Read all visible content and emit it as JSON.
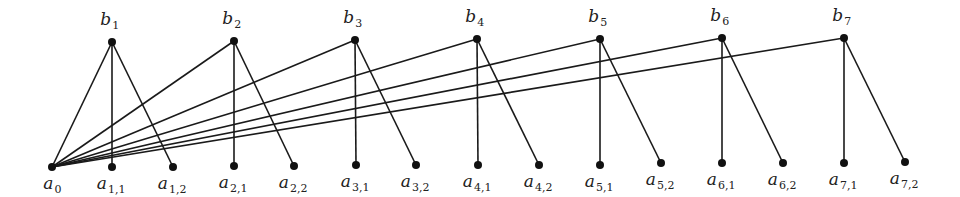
{
  "diagram": {
    "type": "graph",
    "colors": {
      "edge": "#1a1a1a",
      "node": "#111111",
      "label": "#222222",
      "background": "#ffffff"
    },
    "nodes": [
      {
        "id": "a0",
        "base": "a",
        "sub": "0",
        "x": 52,
        "y": 167,
        "label_pos": "below"
      },
      {
        "id": "b1",
        "base": "b",
        "sub": "1",
        "x": 112,
        "y": 42,
        "label_pos": "above"
      },
      {
        "id": "b2",
        "base": "b",
        "sub": "2",
        "x": 234,
        "y": 41,
        "label_pos": "above"
      },
      {
        "id": "b3",
        "base": "b",
        "sub": "3",
        "x": 355,
        "y": 40,
        "label_pos": "above"
      },
      {
        "id": "b4",
        "base": "b",
        "sub": "4",
        "x": 477,
        "y": 39,
        "label_pos": "above"
      },
      {
        "id": "b5",
        "base": "b",
        "sub": "5",
        "x": 600,
        "y": 39,
        "label_pos": "above"
      },
      {
        "id": "b6",
        "base": "b",
        "sub": "6",
        "x": 722,
        "y": 38,
        "label_pos": "above"
      },
      {
        "id": "b7",
        "base": "b",
        "sub": "7",
        "x": 844,
        "y": 38,
        "label_pos": "above"
      },
      {
        "id": "a11",
        "base": "a",
        "sub": "1,1",
        "x": 112,
        "y": 167,
        "label_pos": "below"
      },
      {
        "id": "a12",
        "base": "a",
        "sub": "1,2",
        "x": 173,
        "y": 167,
        "label_pos": "below"
      },
      {
        "id": "a21",
        "base": "a",
        "sub": "2,1",
        "x": 234,
        "y": 166,
        "label_pos": "below"
      },
      {
        "id": "a22",
        "base": "a",
        "sub": "2,2",
        "x": 294,
        "y": 166,
        "label_pos": "below"
      },
      {
        "id": "a31",
        "base": "a",
        "sub": "3,1",
        "x": 356,
        "y": 165,
        "label_pos": "below"
      },
      {
        "id": "a32",
        "base": "a",
        "sub": "3,2",
        "x": 416,
        "y": 165,
        "label_pos": "below"
      },
      {
        "id": "a41",
        "base": "a",
        "sub": "4,1",
        "x": 478,
        "y": 165,
        "label_pos": "below"
      },
      {
        "id": "a42",
        "base": "a",
        "sub": "4,2",
        "x": 539,
        "y": 165,
        "label_pos": "below"
      },
      {
        "id": "a51",
        "base": "a",
        "sub": "5,1",
        "x": 600,
        "y": 165,
        "label_pos": "below"
      },
      {
        "id": "a52",
        "base": "a",
        "sub": "5,2",
        "x": 661,
        "y": 163,
        "label_pos": "below"
      },
      {
        "id": "a61",
        "base": "a",
        "sub": "6,1",
        "x": 722,
        "y": 163,
        "label_pos": "below"
      },
      {
        "id": "a62",
        "base": "a",
        "sub": "6,2",
        "x": 783,
        "y": 163,
        "label_pos": "below"
      },
      {
        "id": "a71",
        "base": "a",
        "sub": "7,1",
        "x": 844,
        "y": 163,
        "label_pos": "below"
      },
      {
        "id": "a72",
        "base": "a",
        "sub": "7,2",
        "x": 905,
        "y": 162,
        "label_pos": "below"
      }
    ],
    "edges": [
      [
        "a0",
        "b1"
      ],
      [
        "a0",
        "b2"
      ],
      [
        "a0",
        "b3"
      ],
      [
        "a0",
        "b4"
      ],
      [
        "a0",
        "b5"
      ],
      [
        "a0",
        "b6"
      ],
      [
        "a0",
        "b7"
      ],
      [
        "b1",
        "a11"
      ],
      [
        "b1",
        "a12"
      ],
      [
        "b2",
        "a21"
      ],
      [
        "b2",
        "a22"
      ],
      [
        "b3",
        "a31"
      ],
      [
        "b3",
        "a32"
      ],
      [
        "b4",
        "a41"
      ],
      [
        "b4",
        "a42"
      ],
      [
        "b5",
        "a51"
      ],
      [
        "b5",
        "a52"
      ],
      [
        "b6",
        "a61"
      ],
      [
        "b6",
        "a62"
      ],
      [
        "b7",
        "a71"
      ],
      [
        "b7",
        "a72"
      ]
    ]
  }
}
